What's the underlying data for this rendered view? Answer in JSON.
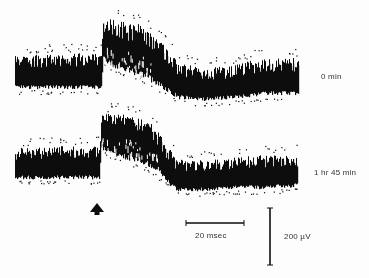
{
  "chart_data": {
    "type": "line",
    "title": "",
    "xlabel": "",
    "ylabel": "",
    "grid": false,
    "legend": null,
    "series": [
      {
        "name": "0 min",
        "label_pos": [
          322,
          77
        ],
        "x_range_px": [
          15,
          298
        ],
        "envelope": [
          {
            "x": 15,
            "top": 55,
            "bot": 90
          },
          {
            "x": 60,
            "top": 54,
            "bot": 90
          },
          {
            "x": 101,
            "top": 52,
            "bot": 90
          },
          {
            "x": 103,
            "top": 18,
            "bot": 62
          },
          {
            "x": 115,
            "top": 20,
            "bot": 70
          },
          {
            "x": 130,
            "top": 22,
            "bot": 75
          },
          {
            "x": 145,
            "top": 26,
            "bot": 80
          },
          {
            "x": 155,
            "top": 35,
            "bot": 86
          },
          {
            "x": 165,
            "top": 45,
            "bot": 92
          },
          {
            "x": 178,
            "top": 62,
            "bot": 100
          },
          {
            "x": 200,
            "top": 68,
            "bot": 102
          },
          {
            "x": 230,
            "top": 66,
            "bot": 100
          },
          {
            "x": 250,
            "top": 60,
            "bot": 98
          },
          {
            "x": 265,
            "top": 58,
            "bot": 96
          },
          {
            "x": 298,
            "top": 58,
            "bot": 96
          }
        ]
      },
      {
        "name": "1 hr 45 min",
        "label_pos": [
          315,
          172
        ],
        "x_range_px": [
          15,
          297
        ],
        "envelope": [
          {
            "x": 15,
            "top": 148,
            "bot": 180
          },
          {
            "x": 60,
            "top": 146,
            "bot": 180
          },
          {
            "x": 99,
            "top": 146,
            "bot": 180
          },
          {
            "x": 101,
            "top": 115,
            "bot": 150
          },
          {
            "x": 115,
            "top": 112,
            "bot": 158
          },
          {
            "x": 130,
            "top": 112,
            "bot": 162
          },
          {
            "x": 148,
            "top": 118,
            "bot": 168
          },
          {
            "x": 160,
            "top": 135,
            "bot": 178
          },
          {
            "x": 176,
            "top": 158,
            "bot": 192
          },
          {
            "x": 200,
            "top": 160,
            "bot": 192
          },
          {
            "x": 230,
            "top": 158,
            "bot": 190
          },
          {
            "x": 260,
            "top": 155,
            "bot": 190
          },
          {
            "x": 297,
            "top": 154,
            "bot": 188
          }
        ]
      }
    ],
    "annotations": [
      {
        "type": "stimulus-arrow",
        "x": 97,
        "y": 209
      },
      {
        "type": "scale-bar-horizontal",
        "label": "20 msec",
        "x1": 186,
        "x2": 244,
        "y": 223
      },
      {
        "type": "scale-bar-vertical",
        "label": "200 µV",
        "x": 270,
        "y1": 208,
        "y2": 265
      }
    ]
  },
  "labels": {
    "trace1": "0 min",
    "trace2": "1 hr 45 min",
    "time_scale": "20 msec",
    "voltage_scale": "200 µV"
  },
  "colors": {
    "ink": "#0d0d0d",
    "background": "#fdfdfd",
    "label": "#333333"
  }
}
